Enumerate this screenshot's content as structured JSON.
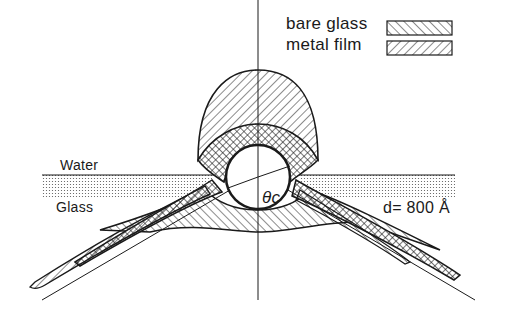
{
  "legend": {
    "items": [
      {
        "label": "bare glass",
        "pattern": "hatch-backslash"
      },
      {
        "label": "metal film",
        "pattern": "hatch-slash"
      }
    ]
  },
  "labels": {
    "water": "Water",
    "glass": "Glass",
    "angle": "θc",
    "thickness": "d= 800 Å"
  },
  "colors": {
    "ink": "#1a1a1a",
    "background": "#ffffff"
  }
}
